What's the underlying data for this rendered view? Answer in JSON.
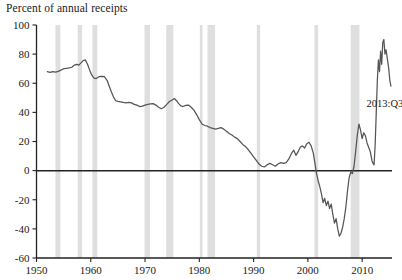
{
  "chart_data": {
    "type": "line",
    "title": "Percent of annual receipts",
    "xlabel": "",
    "ylabel": "Percent of annual receipts",
    "xlim": [
      1950,
      2015.5
    ],
    "ylim": [
      -60,
      100
    ],
    "yticks": [
      100,
      80,
      60,
      40,
      20,
      0,
      -20,
      -40,
      -60
    ],
    "xticks": [
      1950,
      1960,
      1970,
      1980,
      1990,
      2000,
      2010
    ],
    "grid": false,
    "legend": "none",
    "zero_line": 0,
    "annotations": [
      {
        "text": "2013:Q3",
        "x": 2010.8,
        "y": 44
      }
    ],
    "recession_bands": [
      {
        "start": 1953.5,
        "end": 1954.4
      },
      {
        "start": 1957.6,
        "end": 1958.4
      },
      {
        "start": 1960.3,
        "end": 1961.2
      },
      {
        "start": 1969.9,
        "end": 1970.9
      },
      {
        "start": 1973.9,
        "end": 1975.2
      },
      {
        "start": 1980.1,
        "end": 1980.6
      },
      {
        "start": 1981.5,
        "end": 1982.9
      },
      {
        "start": 1990.6,
        "end": 1991.2
      },
      {
        "start": 2001.2,
        "end": 2001.9
      },
      {
        "start": 2007.9,
        "end": 2009.5
      }
    ],
    "series": [
      {
        "name": "Federal debt held by public as percent of annual receipts",
        "color": "#555555",
        "points": [
          [
            1952.0,
            68.0
          ],
          [
            1952.5,
            67.5
          ],
          [
            1953.0,
            68.0
          ],
          [
            1953.5,
            67.6
          ],
          [
            1954.0,
            68.2
          ],
          [
            1954.5,
            69.0
          ],
          [
            1955.0,
            70.0
          ],
          [
            1955.5,
            70.2
          ],
          [
            1956.0,
            70.5
          ],
          [
            1956.5,
            71.0
          ],
          [
            1957.0,
            72.5
          ],
          [
            1957.4,
            73.0
          ],
          [
            1957.8,
            72.4
          ],
          [
            1958.2,
            74.0
          ],
          [
            1958.6,
            75.5
          ],
          [
            1959.0,
            76.0
          ],
          [
            1959.4,
            73.0
          ],
          [
            1959.8,
            69.0
          ],
          [
            1960.2,
            65.5
          ],
          [
            1960.6,
            63.5
          ],
          [
            1961.0,
            63.2
          ],
          [
            1961.5,
            64.5
          ],
          [
            1962.0,
            64.8
          ],
          [
            1962.5,
            64.6
          ],
          [
            1963.0,
            62.0
          ],
          [
            1963.4,
            58.0
          ],
          [
            1963.8,
            54.0
          ],
          [
            1964.2,
            50.5
          ],
          [
            1964.6,
            48.0
          ],
          [
            1965.0,
            47.5
          ],
          [
            1965.5,
            47.2
          ],
          [
            1966.0,
            46.8
          ],
          [
            1966.5,
            46.5
          ],
          [
            1967.0,
            46.9
          ],
          [
            1967.5,
            46.5
          ],
          [
            1968.0,
            45.5
          ],
          [
            1968.5,
            45.0
          ],
          [
            1969.0,
            44.0
          ],
          [
            1969.5,
            44.3
          ],
          [
            1970.0,
            45.0
          ],
          [
            1970.5,
            45.5
          ],
          [
            1971.0,
            45.8
          ],
          [
            1971.5,
            46.0
          ],
          [
            1972.0,
            45.0
          ],
          [
            1972.5,
            43.5
          ],
          [
            1973.0,
            42.5
          ],
          [
            1973.5,
            43.5
          ],
          [
            1974.0,
            45.5
          ],
          [
            1974.5,
            47.5
          ],
          [
            1975.0,
            48.5
          ],
          [
            1975.4,
            49.5
          ],
          [
            1975.8,
            48.0
          ],
          [
            1976.2,
            46.0
          ],
          [
            1976.6,
            44.5
          ],
          [
            1977.0,
            44.0
          ],
          [
            1977.5,
            44.8
          ],
          [
            1978.0,
            45.0
          ],
          [
            1978.5,
            43.5
          ],
          [
            1979.0,
            41.5
          ],
          [
            1979.5,
            38.5
          ],
          [
            1980.0,
            35.0
          ],
          [
            1980.5,
            32.0
          ],
          [
            1981.0,
            31.0
          ],
          [
            1981.5,
            30.5
          ],
          [
            1982.0,
            29.5
          ],
          [
            1982.5,
            29.0
          ],
          [
            1983.0,
            28.5
          ],
          [
            1983.5,
            29.0
          ],
          [
            1984.0,
            29.5
          ],
          [
            1984.5,
            28.5
          ],
          [
            1985.0,
            27.0
          ],
          [
            1985.5,
            25.5
          ],
          [
            1986.0,
            24.5
          ],
          [
            1986.5,
            23.0
          ],
          [
            1987.0,
            22.0
          ],
          [
            1987.5,
            20.0
          ],
          [
            1988.0,
            18.0
          ],
          [
            1988.5,
            16.5
          ],
          [
            1989.0,
            14.5
          ],
          [
            1989.5,
            12.0
          ],
          [
            1990.0,
            9.5
          ],
          [
            1990.5,
            7.0
          ],
          [
            1991.0,
            4.5
          ],
          [
            1991.5,
            3.0
          ],
          [
            1992.0,
            2.5
          ],
          [
            1992.5,
            4.0
          ],
          [
            1993.0,
            5.0
          ],
          [
            1993.5,
            4.0
          ],
          [
            1994.0,
            3.0
          ],
          [
            1994.5,
            4.5
          ],
          [
            1995.0,
            5.5
          ],
          [
            1995.5,
            5.0
          ],
          [
            1996.0,
            5.5
          ],
          [
            1996.5,
            8.0
          ],
          [
            1997.0,
            12.0
          ],
          [
            1997.4,
            14.0
          ],
          [
            1997.8,
            10.5
          ],
          [
            1998.2,
            13.0
          ],
          [
            1998.6,
            16.0
          ],
          [
            1999.0,
            17.0
          ],
          [
            1999.4,
            15.5
          ],
          [
            1999.8,
            18.5
          ],
          [
            2000.2,
            19.5
          ],
          [
            2000.6,
            17.0
          ],
          [
            2001.0,
            12.0
          ],
          [
            2001.3,
            5.0
          ],
          [
            2001.6,
            -2.0
          ],
          [
            2001.9,
            -7.0
          ],
          [
            2002.2,
            -11.0
          ],
          [
            2002.5,
            -16.0
          ],
          [
            2002.8,
            -22.0
          ],
          [
            2003.1,
            -19.0
          ],
          [
            2003.4,
            -24.0
          ],
          [
            2003.7,
            -21.0
          ],
          [
            2004.0,
            -26.0
          ],
          [
            2004.3,
            -23.0
          ],
          [
            2004.6,
            -30.0
          ],
          [
            2004.9,
            -36.0
          ],
          [
            2005.2,
            -33.0
          ],
          [
            2005.5,
            -40.0
          ],
          [
            2005.8,
            -45.0
          ],
          [
            2006.1,
            -43.0
          ],
          [
            2006.4,
            -39.0
          ],
          [
            2006.7,
            -33.0
          ],
          [
            2007.0,
            -25.0
          ],
          [
            2007.3,
            -14.0
          ],
          [
            2007.6,
            -5.0
          ],
          [
            2007.9,
            -1.0
          ],
          [
            2008.2,
            -2.0
          ],
          [
            2008.5,
            3.0
          ],
          [
            2008.8,
            13.0
          ],
          [
            2009.1,
            24.0
          ],
          [
            2009.4,
            32.0
          ],
          [
            2009.7,
            28.0
          ],
          [
            2010.0,
            22.0
          ],
          [
            2010.3,
            26.0
          ],
          [
            2010.6,
            24.0
          ],
          [
            2010.9,
            19.0
          ],
          [
            2011.2,
            16.0
          ],
          [
            2011.5,
            13.0
          ],
          [
            2011.8,
            7.0
          ],
          [
            2012.0,
            5.0
          ],
          [
            2012.2,
            4.0
          ],
          [
            2012.4,
            18.0
          ],
          [
            2012.6,
            40.0
          ],
          [
            2012.8,
            62.0
          ],
          [
            2013.0,
            76.0
          ],
          [
            2013.2,
            68.0
          ],
          [
            2013.4,
            82.0
          ],
          [
            2013.6,
            73.0
          ],
          [
            2013.8,
            88.0
          ],
          [
            2014.0,
            90.0
          ],
          [
            2014.2,
            80.0
          ],
          [
            2014.4,
            83.0
          ],
          [
            2014.6,
            78.0
          ],
          [
            2014.9,
            70.0
          ],
          [
            2015.1,
            62.0
          ],
          [
            2015.3,
            58.0
          ]
        ]
      }
    ]
  }
}
